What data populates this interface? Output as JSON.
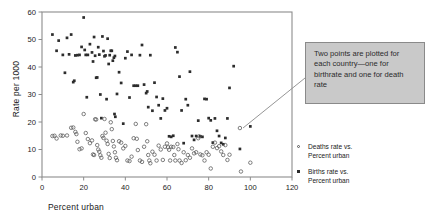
{
  "chart_data": {
    "type": "scatter",
    "title": "",
    "xlabel": "Percent urban",
    "ylabel": "Rate per 1000",
    "xlim": [
      0,
      120
    ],
    "ylim": [
      0,
      60
    ],
    "xticks": [
      0,
      20,
      40,
      60,
      80,
      100,
      120
    ],
    "yticks": [
      0,
      10,
      20,
      30,
      40,
      50,
      60
    ],
    "grid": false,
    "legend_position": "right",
    "frame": "box",
    "series": [
      {
        "name": "Births rate vs. Percent urban",
        "marker": "filled-square",
        "color": "#2c2c2c",
        "points": [
          [
            5,
            51.8
          ],
          [
            7,
            45.9
          ],
          [
            8,
            49.6
          ],
          [
            10,
            44.4
          ],
          [
            11,
            37.9
          ],
          [
            12,
            50.6
          ],
          [
            13,
            44.6
          ],
          [
            14,
            51.8
          ],
          [
            15,
            34.5
          ],
          [
            15.5,
            35.0
          ],
          [
            16,
            44.2
          ],
          [
            17,
            44.3
          ],
          [
            18,
            44.4
          ],
          [
            19,
            47.3
          ],
          [
            20,
            58.0
          ],
          [
            20.5,
            46.2
          ],
          [
            21,
            44.4
          ],
          [
            21.5,
            29.0
          ],
          [
            22,
            44.4
          ],
          [
            23,
            48.3
          ],
          [
            24,
            45.3
          ],
          [
            24.5,
            42.0
          ],
          [
            25,
            50.9
          ],
          [
            25.5,
            44.1
          ],
          [
            26,
            36.1
          ],
          [
            26.5,
            36.2
          ],
          [
            27,
            47.2
          ],
          [
            27.5,
            44.5
          ],
          [
            28,
            30.0
          ],
          [
            28.5,
            21.4
          ],
          [
            29,
            51.1
          ],
          [
            29.5,
            45.8
          ],
          [
            30,
            43.9
          ],
          [
            30.5,
            44.2
          ],
          [
            31,
            28.3
          ],
          [
            31.5,
            50.3
          ],
          [
            32,
            41.1
          ],
          [
            32.5,
            44.3
          ],
          [
            33,
            45.9
          ],
          [
            33.5,
            45.9
          ],
          [
            34,
            42.3
          ],
          [
            34.5,
            43.4
          ],
          [
            34.8,
            22.9
          ],
          [
            35,
            44.0
          ],
          [
            35.2,
            21.9
          ],
          [
            36,
            30.2
          ],
          [
            37,
            38.1
          ],
          [
            38,
            34.2
          ],
          [
            39,
            19.4
          ],
          [
            40,
            43.2
          ],
          [
            41,
            45.6
          ],
          [
            42,
            28.9
          ],
          [
            43,
            44.4
          ],
          [
            44,
            33.2
          ],
          [
            45,
            33.2
          ],
          [
            46,
            33.2
          ],
          [
            47,
            44.3
          ],
          [
            48,
            48.0
          ],
          [
            49,
            33.6
          ],
          [
            50,
            30.5
          ],
          [
            50.5,
            31.1
          ],
          [
            51,
            25.4
          ],
          [
            52,
            44.3
          ],
          [
            53,
            24.1
          ],
          [
            54,
            34.3
          ],
          [
            55,
            29.1
          ],
          [
            56,
            26.1
          ],
          [
            57,
            21.3
          ],
          [
            58,
            28.5
          ],
          [
            59,
            24.2
          ],
          [
            60,
            25.0
          ],
          [
            61,
            14.8
          ],
          [
            62,
            14.6
          ],
          [
            63,
            15.0
          ],
          [
            64,
            47.1
          ],
          [
            65,
            45.4
          ],
          [
            66,
            36.5
          ],
          [
            67,
            24.2
          ],
          [
            68,
            12.3
          ],
          [
            69,
            28.3
          ],
          [
            70,
            26.1
          ],
          [
            71,
            38.3
          ],
          [
            72,
            14.9
          ],
          [
            73,
            13.5
          ],
          [
            74,
            14.9
          ],
          [
            75,
            20.5
          ],
          [
            76,
            14.8
          ],
          [
            77,
            14.6
          ],
          [
            78,
            28.4
          ],
          [
            79,
            28.3
          ],
          [
            80,
            21.4
          ],
          [
            81,
            20.6
          ],
          [
            82,
            12.5
          ],
          [
            83,
            21.3
          ],
          [
            84,
            16.8
          ],
          [
            85,
            14.9
          ],
          [
            86,
            12.4
          ],
          [
            87,
            11.9
          ],
          [
            88,
            14.2
          ],
          [
            89,
            21.3
          ],
          [
            90,
            32.4
          ],
          [
            92,
            40.3
          ],
          [
            95,
            10.2
          ],
          [
            100,
            18.4
          ]
        ]
      },
      {
        "name": "Deaths rate vs. Percent urban",
        "marker": "open-circle",
        "color": "#555555",
        "points": [
          [
            5,
            14.9
          ],
          [
            6,
            15.0
          ],
          [
            7,
            14.0
          ],
          [
            9,
            15.1
          ],
          [
            10,
            15.0
          ],
          [
            12,
            15.1
          ],
          [
            14,
            17.9
          ],
          [
            15,
            18.0
          ],
          [
            16,
            16.4
          ],
          [
            16.5,
            15.6
          ],
          [
            17,
            12.8
          ],
          [
            18,
            10.1
          ],
          [
            19,
            10.4
          ],
          [
            20,
            22.9
          ],
          [
            21,
            16.0
          ],
          [
            22,
            13.8
          ],
          [
            23,
            12.3
          ],
          [
            24,
            13.3
          ],
          [
            24.5,
            8.2
          ],
          [
            25,
            8.0
          ],
          [
            25.5,
            21.0
          ],
          [
            26,
            20.9
          ],
          [
            26.5,
            11.6
          ],
          [
            27,
            10.0
          ],
          [
            27.5,
            9.2
          ],
          [
            28,
            7.9
          ],
          [
            28.5,
            7.0
          ],
          [
            29,
            14.9
          ],
          [
            29.5,
            14.2
          ],
          [
            30,
            21.1
          ],
          [
            30.5,
            16.1
          ],
          [
            31,
            13.2
          ],
          [
            31.5,
            12.0
          ],
          [
            32,
            8.4
          ],
          [
            32.5,
            6.9
          ],
          [
            33,
            19.9
          ],
          [
            33.5,
            17.4
          ],
          [
            34,
            13.1
          ],
          [
            34.5,
            11.1
          ],
          [
            35,
            9.0
          ],
          [
            35.5,
            7.0
          ],
          [
            36,
            6.1
          ],
          [
            37,
            13.0
          ],
          [
            38,
            12.5
          ],
          [
            39,
            10.4
          ],
          [
            40,
            11.3
          ],
          [
            41,
            6.0
          ],
          [
            42,
            5.8
          ],
          [
            43,
            7.4
          ],
          [
            44,
            14.1
          ],
          [
            45,
            19.3
          ],
          [
            45.5,
            13.9
          ],
          [
            46,
            9.8
          ],
          [
            47,
            6.0
          ],
          [
            48,
            5.5
          ],
          [
            49,
            11.0
          ],
          [
            50,
            19.2
          ],
          [
            50.5,
            13.0
          ],
          [
            51,
            8.0
          ],
          [
            51.5,
            6.0
          ],
          [
            52,
            5.0
          ],
          [
            53,
            9.2
          ],
          [
            54,
            8.1
          ],
          [
            55,
            6.0
          ],
          [
            56,
            11.4
          ],
          [
            57,
            10.0
          ],
          [
            58,
            6.2
          ],
          [
            59,
            11.0
          ],
          [
            60,
            12.2
          ],
          [
            60.5,
            10.8
          ],
          [
            61,
            9.9
          ],
          [
            61.5,
            6.0
          ],
          [
            62,
            11.0
          ],
          [
            63,
            10.9
          ],
          [
            63.5,
            8.0
          ],
          [
            64,
            6.0
          ],
          [
            65,
            12.0
          ],
          [
            65.5,
            10.1
          ],
          [
            66,
            6.0
          ],
          [
            67,
            5.1
          ],
          [
            68,
            9.0
          ],
          [
            69,
            6.1
          ],
          [
            70,
            8.0
          ],
          [
            71,
            7.0
          ],
          [
            72,
            10.4
          ],
          [
            73,
            8.6
          ],
          [
            74,
            9.0
          ],
          [
            75,
            14.1
          ],
          [
            75.5,
            14.8
          ],
          [
            76,
            8.2
          ],
          [
            77,
            7.9
          ],
          [
            78,
            6.0
          ],
          [
            79,
            9.0
          ],
          [
            80,
            8.1
          ],
          [
            81,
            3.1
          ],
          [
            82,
            11.0
          ],
          [
            83,
            12.5
          ],
          [
            84,
            10.5
          ],
          [
            85,
            11.2
          ],
          [
            86,
            9.3
          ],
          [
            87,
            8.0
          ],
          [
            88,
            11.6
          ],
          [
            89,
            6.2
          ],
          [
            90,
            8.1
          ],
          [
            95,
            17.8
          ],
          [
            95.5,
            2.0
          ],
          [
            100,
            5.2
          ]
        ]
      }
    ]
  },
  "annotation": {
    "text": "Two points are plotted for each country—one for birthrate and one for death rate",
    "background": "#c9c9c9",
    "border": "#8a8a8a",
    "leader_from": [
      305,
      78
    ],
    "leader_to": [
      243,
      128
    ]
  },
  "legend": {
    "entries": [
      {
        "marker": "open-circle",
        "line1": "Deaths rate vs.",
        "line2": "Percent urban"
      },
      {
        "marker": "filled-square",
        "line1": "Births rate vs.",
        "line2": "Percent urban"
      }
    ]
  },
  "colors": {
    "background": "#ffffff",
    "axis": "#8c8c8c",
    "text": "#1a1a1a",
    "births_marker": "#2c2c2c",
    "deaths_marker": "#555555"
  }
}
